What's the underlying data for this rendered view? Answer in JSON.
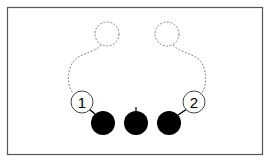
{
  "diagram": {
    "title": "",
    "frame": {
      "stroke": "#555555"
    },
    "ghost_balls": [
      {
        "cx": 107,
        "cy": 34,
        "r": 12
      },
      {
        "cx": 167,
        "cy": 34,
        "r": 12
      }
    ],
    "numbered_balls": [
      {
        "label": "1",
        "cx": 82,
        "cy": 102,
        "r": 11
      },
      {
        "label": "2",
        "cx": 194,
        "cy": 102,
        "r": 11
      }
    ],
    "solid_balls": [
      {
        "cx": 103,
        "cy": 123,
        "r": 12
      },
      {
        "cx": 136,
        "cy": 123,
        "r": 12
      },
      {
        "cx": 169,
        "cy": 123,
        "r": 12
      }
    ],
    "colors": {
      "solid": "#000000",
      "outline": "#444444",
      "dashed": "#777777"
    }
  }
}
